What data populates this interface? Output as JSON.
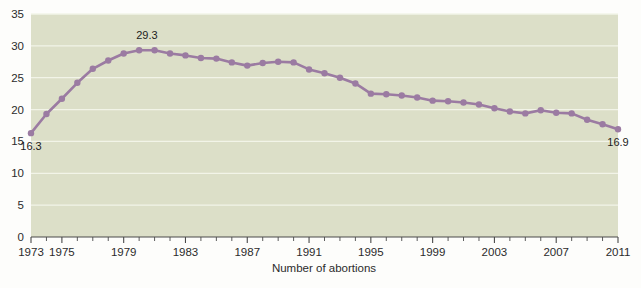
{
  "chart_data": {
    "type": "line",
    "title": "",
    "xlabel": "Number of abortions",
    "ylabel": "",
    "grid": true,
    "legend": false,
    "xlim": [
      1973,
      2011
    ],
    "ylim": [
      0,
      35
    ],
    "ytick_labels": [
      "0",
      "5",
      "10",
      "15",
      "20",
      "25",
      "30",
      "35"
    ],
    "ytick_values": [
      0,
      5,
      10,
      15,
      20,
      25,
      30,
      35
    ],
    "xtick_labels": [
      "1973",
      "1975",
      "1979",
      "1983",
      "1987",
      "1991",
      "1995",
      "1999",
      "2003",
      "2007",
      "2011"
    ],
    "xtick_values": [
      1973,
      1975,
      1979,
      1983,
      1987,
      1991,
      1995,
      1999,
      2003,
      2007,
      2011
    ],
    "x": [
      1973,
      1974,
      1975,
      1976,
      1977,
      1978,
      1979,
      1980,
      1981,
      1982,
      1983,
      1984,
      1985,
      1986,
      1987,
      1988,
      1989,
      1990,
      1991,
      1992,
      1993,
      1994,
      1995,
      1996,
      1997,
      1998,
      1999,
      2000,
      2001,
      2002,
      2003,
      2004,
      2005,
      2006,
      2007,
      2008,
      2009,
      2010,
      2011
    ],
    "values": [
      16.3,
      19.3,
      21.7,
      24.2,
      26.4,
      27.7,
      28.8,
      29.3,
      29.3,
      28.8,
      28.5,
      28.1,
      28.0,
      27.4,
      26.9,
      27.3,
      27.5,
      27.4,
      26.3,
      25.7,
      25.0,
      24.1,
      22.5,
      22.4,
      22.2,
      21.9,
      21.4,
      21.3,
      21.1,
      20.8,
      20.2,
      19.7,
      19.4,
      19.9,
      19.5,
      19.4,
      18.4,
      17.7,
      16.9
    ],
    "point_labels": [
      {
        "x": 1973,
        "value": 16.3,
        "text": "16.3",
        "position": "below"
      },
      {
        "x": 1980.5,
        "value": 29.3,
        "text": "29.3",
        "position": "above"
      },
      {
        "x": 2011,
        "value": 16.9,
        "text": "16.9",
        "position": "below"
      }
    ],
    "colors": {
      "line": "#9b7ba2",
      "marker": "#9b7ba2",
      "plot_background": "#dcdfc8",
      "page_background": "#fdfdfb",
      "gridline": "#f2f4e8",
      "axis": "#4a4a4a",
      "tick_label": "#2b2b2b"
    }
  }
}
